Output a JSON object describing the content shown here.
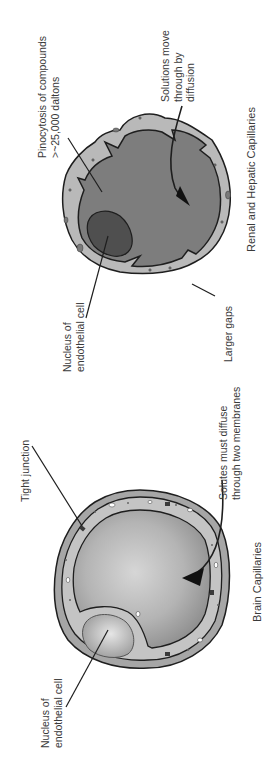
{
  "figure": {
    "orientation": "rotated-90-ccw",
    "colors": {
      "background": "#ffffff",
      "renal_lumen": "#7d7d7d",
      "renal_wall": "#b9b9b9",
      "renal_nucleus": "#4f4f4f",
      "brain_lumen_light": "#d2d2d2",
      "brain_lumen_dark": "#9a9a9a",
      "brain_wall": "#a6a6a6",
      "outline": "#1e1e1e",
      "text": "#3a3a3a"
    }
  },
  "renal_hepatic": {
    "title": "Renal and Hepatic Capillaries",
    "labels": {
      "pinocytosis_line1": "Pinocytosis of compounds",
      "pinocytosis_line2": ">~25,000 daltons",
      "diffusion_line1": "Solutions move",
      "diffusion_line2": "through by",
      "diffusion_line3": "diffusion",
      "larger_gaps": "Larger gaps",
      "nucleus_line1": "Nucleus of",
      "nucleus_line2": "endothelial cell"
    }
  },
  "brain": {
    "title": "Brain Capillaries",
    "labels": {
      "tight_junction": "Tight junction",
      "solutes_line1": "Solutes must diffuse",
      "solutes_line2": "through two membranes",
      "nucleus_line1": "Nucleus of",
      "nucleus_line2": "endothelial cell"
    }
  }
}
